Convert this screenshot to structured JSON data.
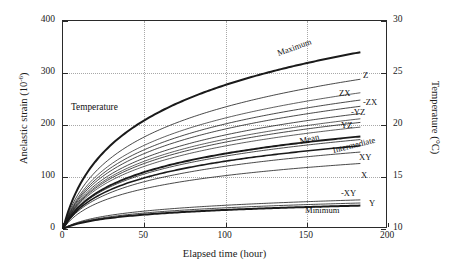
{
  "chart_data": {
    "type": "line",
    "title": "",
    "xlabel": "Elapsed time (hour)",
    "ylabel": "Anelastic strain (10",
    "ylabel_sup": "-6",
    "ylabel_tail": ")",
    "y2label": "Temperature (°C)",
    "xlim": [
      0,
      200
    ],
    "ylim": [
      0,
      400
    ],
    "y2lim": [
      10,
      30
    ],
    "xticks": [
      "0",
      "50",
      "100",
      "150",
      "200"
    ],
    "xtick_values": [
      0,
      50,
      100,
      150,
      200
    ],
    "yticks": [
      "0",
      "100",
      "200",
      "300",
      "400"
    ],
    "ytick_values": [
      0,
      100,
      200,
      300,
      400
    ],
    "y2ticks": [
      "10",
      "15",
      "20",
      "25",
      "30"
    ],
    "y2tick_values": [
      10,
      15,
      20,
      25,
      30
    ],
    "grid": "dotted major gridlines both axes",
    "legend": "inline curve end labels",
    "x_end": 183,
    "annotation": "Temperature",
    "annotation_note": "horizontal thin temperature trace near 210 strain units",
    "series": [
      {
        "name": "Maximum",
        "label": "Maximum",
        "end_value": 340,
        "weight": 2.0,
        "label_rotate": -20,
        "label_x": 278,
        "label_y": 48
      },
      {
        "name": "Z",
        "label": "Z",
        "end_value": 288,
        "weight": 0.8,
        "label_rotate": 0,
        "label_x": 362,
        "label_y": 70
      },
      {
        "name": "ZX",
        "label": "ZX",
        "end_value": 248,
        "weight": 0.8,
        "label_rotate": 0,
        "label_x": 338,
        "label_y": 88
      },
      {
        "name": "-ZX",
        "label": "-ZX",
        "end_value": 236,
        "weight": 0.8,
        "label_rotate": 0,
        "label_x": 362,
        "label_y": 97
      },
      {
        "name": "-YZ",
        "label": "-YZ",
        "end_value": 222,
        "weight": 0.8,
        "label_rotate": 0,
        "label_x": 350,
        "label_y": 107
      },
      {
        "name": "YZ",
        "label": "YZ",
        "end_value": 205,
        "weight": 0.8,
        "label_rotate": 0,
        "label_x": 340,
        "label_y": 120
      },
      {
        "name": "Mean",
        "label": "Mean",
        "end_value": 178,
        "weight": 1.9,
        "label_rotate": -14,
        "label_x": 300,
        "label_y": 136
      },
      {
        "name": "Intermediate",
        "label": "Intermediate",
        "end_value": 172,
        "weight": 0.8,
        "label_rotate": -14,
        "label_x": 333,
        "label_y": 145
      },
      {
        "name": "XY",
        "label": "XY",
        "end_value": 148,
        "weight": 0.8,
        "label_rotate": 0,
        "label_x": 358,
        "label_y": 152
      },
      {
        "name": "X",
        "label": "X",
        "end_value": 126,
        "weight": 0.8,
        "label_rotate": 0,
        "label_x": 360,
        "label_y": 170
      },
      {
        "name": "-XY",
        "label": "-XY",
        "end_value": 56,
        "weight": 0.8,
        "label_rotate": 0,
        "label_x": 340,
        "label_y": 188
      },
      {
        "name": "Y",
        "label": "Y",
        "end_value": 50,
        "weight": 0.8,
        "label_rotate": 0,
        "label_x": 368,
        "label_y": 198
      },
      {
        "name": "Minimum",
        "label": "Minimum",
        "end_value": 45,
        "weight": 2.0,
        "label_rotate": 0,
        "label_x": 304,
        "label_y": 205
      },
      {
        "name": "extra-a",
        "label": "",
        "end_value": 262,
        "weight": 0.7,
        "label_rotate": 0,
        "label_x": 0,
        "label_y": 0
      },
      {
        "name": "extra-b",
        "label": "",
        "end_value": 196,
        "weight": 0.7,
        "label_rotate": 0,
        "label_x": 0,
        "label_y": 0
      },
      {
        "name": "extra-c",
        "label": "",
        "end_value": 160,
        "weight": 1.6,
        "label_rotate": 0,
        "label_x": 0,
        "label_y": 0
      },
      {
        "name": "temperature",
        "label": "",
        "end_value": 212,
        "weight": 0.7,
        "label_rotate": 0,
        "label_x": 0,
        "label_y": 0
      }
    ],
    "colors": {
      "line": "#1a1a1a",
      "grid": "#a8a8a8",
      "axis": "#2a2a2a",
      "background": "#ffffff"
    }
  }
}
